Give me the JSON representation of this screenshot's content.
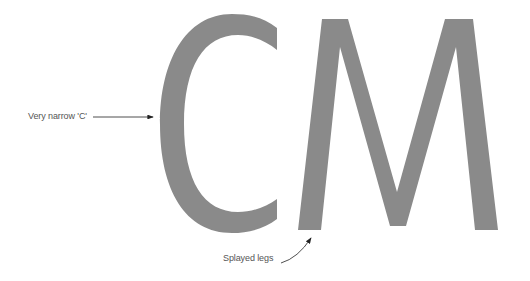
{
  "diagram": {
    "glyphs": "CM",
    "glyph_color": "#8a8a8a",
    "annotation_color": "#555555",
    "annotations": [
      {
        "id": "narrow-c",
        "text": "Very narrow 'C'",
        "target": "C"
      },
      {
        "id": "splayed-legs",
        "text": "Splayed legs",
        "target": "M left leg"
      }
    ]
  }
}
